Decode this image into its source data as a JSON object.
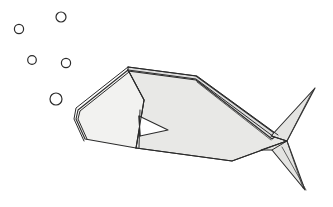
{
  "scene": {
    "title": "Origami Paper Fish",
    "subject": "origami-fish",
    "background_color": "#ffffff",
    "width": 333,
    "height": 207,
    "style": "line-drawing"
  },
  "palette": {
    "outline": "#2b2b2b",
    "body_fill": "#e8e8e6",
    "head_fill": "#f2f2f0",
    "highlight_fill": "#efefed",
    "tail_fill": "#e4e4e2",
    "fin_fill": "#ffffff",
    "background": "#ffffff"
  },
  "fish": {
    "name": "origami-fish",
    "facing": "left",
    "parts": [
      {
        "name": "head-panel",
        "label": "Head",
        "fill": "#f2f2f0",
        "points": "128,70 78,110 76,119 85,139 136,148 144,100"
      },
      {
        "name": "body-panel",
        "label": "Body",
        "fill": "#e8e8e6",
        "points": "128,70 196,79 272,136 287,141 232,161 136,148 144,100"
      },
      {
        "name": "upper-back-panel",
        "label": "Upper back fold",
        "fill": "#dedede",
        "points": "128,67 196,76 277,135 272,139 196,80 128,71"
      },
      {
        "name": "tail-upper-fin",
        "label": "Upper tail fin",
        "fill": "#e4e4e2",
        "points": "287,141 315,88 271,136"
      },
      {
        "name": "tail-lower-fin",
        "label": "Lower tail fin",
        "fill": "#e4e4e2",
        "points": "287,141 305,190 272,150 261,150"
      },
      {
        "name": "pectoral-fin",
        "label": "Pectoral fin",
        "fill": "#ffffff",
        "points": "139,116 168,130 140,136"
      }
    ],
    "fold_lines": [
      {
        "name": "snout-fold-outer",
        "path": "M 128,67 L 76,108 L 74,119 L 84,141"
      },
      {
        "name": "snout-fold-inner",
        "path": "M 129,72 L 80,111 L 78,119 L 87,139"
      },
      {
        "name": "head-crease",
        "path": "M 128,70 L 144,100 L 136,148"
      },
      {
        "name": "back-ridge-1",
        "path": "M 128,67 L 197,76 L 278,135"
      },
      {
        "name": "back-ridge-2",
        "path": "M 128,70 L 196,79 L 274,137"
      },
      {
        "name": "back-ridge-3",
        "path": "M 197,82 L 271,140"
      },
      {
        "name": "belly-line",
        "path": "M 136,148 L 232,161 L 287,141"
      },
      {
        "name": "tail-junction-crease",
        "path": "M 272,136 L 287,141 L 272,150"
      },
      {
        "name": "tail-upper-crease",
        "path": "M 287,141 L 312,92"
      },
      {
        "name": "tail-lower-crease",
        "path": "M 287,141 L 303,188"
      },
      {
        "name": "tail-lower-crease-2",
        "path": "M 282,147 L 306,190"
      },
      {
        "name": "fin-crease",
        "path": "M 139,116 L 140,136"
      },
      {
        "name": "fin-base",
        "path": "M 140,110 L 139,148"
      }
    ]
  },
  "bubbles": [
    {
      "name": "bubble-1",
      "cx": 61,
      "cy": 17,
      "r": 5.0
    },
    {
      "name": "bubble-2",
      "cx": 19,
      "cy": 29,
      "r": 4.6
    },
    {
      "name": "bubble-3",
      "cx": 32,
      "cy": 60,
      "r": 4.3
    },
    {
      "name": "bubble-4",
      "cx": 66,
      "cy": 63,
      "r": 4.6
    },
    {
      "name": "bubble-5",
      "cx": 56,
      "cy": 99,
      "r": 6.0
    }
  ],
  "bubble_count_label": "5"
}
